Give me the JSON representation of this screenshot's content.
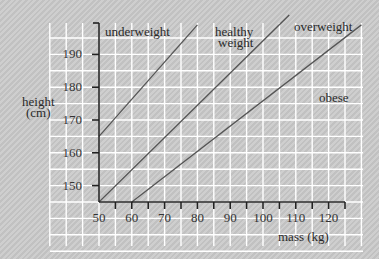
{
  "chart_data": {
    "type": "line",
    "title": "",
    "xlabel": "mass (kg)",
    "ylabel": "height (cm)",
    "ylabel_lines": [
      "height",
      "(cm)"
    ],
    "xlim": [
      50,
      125
    ],
    "ylim": [
      145,
      199
    ],
    "x_ticks": [
      50,
      60,
      70,
      80,
      90,
      100,
      110,
      120
    ],
    "y_ticks": [
      150,
      160,
      170,
      180,
      190
    ],
    "grid": true,
    "series": [
      {
        "name": "underweight / healthy boundary",
        "points": [
          [
            50,
            165
          ],
          [
            80,
            199
          ]
        ]
      },
      {
        "name": "healthy / overweight boundary",
        "points": [
          [
            50,
            145
          ],
          [
            108,
            202
          ]
        ]
      },
      {
        "name": "overweight / obese boundary",
        "points": [
          [
            60,
            145
          ],
          [
            130,
            199
          ]
        ]
      }
    ],
    "region_labels": [
      {
        "text": "underweight"
      },
      {
        "text_lines": [
          "healthy",
          "weight"
        ]
      },
      {
        "text": "overweight"
      },
      {
        "text": "obese"
      }
    ]
  },
  "labels": {
    "underweight": "underweight",
    "healthy_1": "healthy",
    "healthy_2": "weight",
    "overweight": "overweight",
    "obese": "obese",
    "ylabel_1": "height",
    "ylabel_2": "(cm)",
    "xlabel": "mass (kg)",
    "x_ticks": [
      "50",
      "60",
      "70",
      "80",
      "90",
      "100",
      "110",
      "120"
    ],
    "y_ticks": [
      "150",
      "160",
      "170",
      "180",
      "190"
    ]
  },
  "colors": {
    "background": "#c9c9c9",
    "grid": "#ffffff",
    "axis": "#222222",
    "line": "#555555"
  }
}
